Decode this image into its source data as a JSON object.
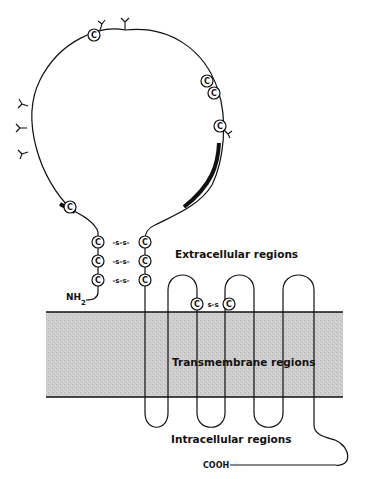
{
  "diagram": {
    "labels": {
      "extracellular": "Extracellular regions",
      "transmembrane": "Transmembrane regions",
      "intracellular": "Intracellular regions",
      "n_terminus": "NH",
      "n_terminus_sub": "2",
      "c_terminus": "COOH"
    },
    "cysteine_label": "C",
    "disulfide_label": "-s-s-",
    "disulfide_short": "s-s",
    "colors": {
      "line": "#111111",
      "membrane": "#c9c9c9",
      "background": "#ffffff"
    }
  }
}
